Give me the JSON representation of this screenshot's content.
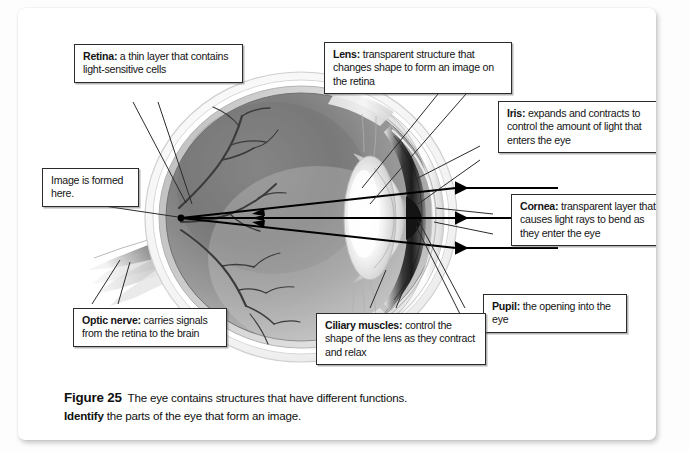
{
  "figure": {
    "caption": {
      "figure_number": "Figure 25",
      "caption_text": "The eye contains structures that have different functions.",
      "task_verb": "Identify",
      "task_text": "the parts of the eye that form an image."
    },
    "callouts": [
      {
        "id": "retina",
        "term": "Retina:",
        "description": " a thin layer that contains light-sensitive cells"
      },
      {
        "id": "image-formed",
        "term": "",
        "description": "Image is formed here."
      },
      {
        "id": "lens",
        "term": "Lens:",
        "description": " transparent structure that changes shape to form an image on the retina"
      },
      {
        "id": "iris",
        "term": "Iris:",
        "description": " expands and contracts to control the amount of light that enters the eye"
      },
      {
        "id": "cornea",
        "term": "Cornea:",
        "description": " transparent layer that causes light rays to bend as they enter the eye"
      },
      {
        "id": "pupil",
        "term": "Pupil:",
        "description": " the opening into the eye"
      },
      {
        "id": "ciliary-muscles",
        "term": "Ciliary muscles:",
        "description": " control the shape of the lens as they contract and relax"
      },
      {
        "id": "optic-nerve",
        "term": "Optic nerve:",
        "description": " carries signals from the retina to the brain"
      }
    ],
    "light_rays": {
      "count": 3,
      "direction": "right-to-left",
      "converge_label": "Image is formed here."
    },
    "colors": {
      "page_background": "#ffffff",
      "card_background": "#ffffff",
      "callout_border": "#2b2b2b",
      "text": "#141414",
      "sclera_outer": "#f0f0f0",
      "vitreous_dark": "#6f6f6f",
      "vitreous_light": "#c8c8c8",
      "lens_highlight": "#fafafa",
      "iris_dark": "#2a2a2a"
    }
  }
}
